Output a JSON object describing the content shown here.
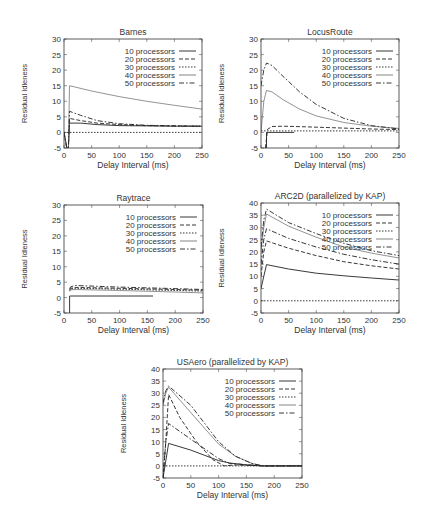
{
  "figure": {
    "ylabel": "Residual Idleness",
    "xlabel": "Delay Interval (ms)"
  },
  "chart_data": [
    {
      "id": "barnes",
      "type": "line",
      "title": "Barnes",
      "xlabel": "Delay Interval (ms)",
      "ylabel": "Residual Idleness",
      "xlim": [
        0,
        250
      ],
      "ylim": [
        -5,
        30
      ],
      "xticks": [
        0,
        50,
        100,
        150,
        200,
        250
      ],
      "yticks": [
        -5,
        0,
        5,
        10,
        15,
        20,
        25,
        30
      ],
      "legend_position": "upper right",
      "grid": false,
      "box": {
        "x": 64,
        "y": 39,
        "w": 138,
        "h": 109
      },
      "series": [
        {
          "name": "10 processors",
          "dash": "",
          "x": [
            0,
            5,
            8,
            10,
            30,
            60,
            100,
            150,
            200,
            250
          ],
          "values": [
            0,
            -5,
            -5,
            3,
            3,
            2.5,
            2.2,
            2.1,
            2.0,
            2.0
          ]
        },
        {
          "name": "20 processors",
          "dash": "4,2",
          "x": [
            0,
            5,
            8,
            10,
            30,
            60,
            100,
            150,
            200,
            250
          ],
          "values": [
            0,
            -5,
            -5,
            4.5,
            3.8,
            3.0,
            2.5,
            2.2,
            2.1,
            2.0
          ]
        },
        {
          "name": "30 processors",
          "dash": "1.5,1.5",
          "x": [
            0,
            250
          ],
          "values": [
            0,
            0
          ]
        },
        {
          "name": "40 processors",
          "dash": "",
          "light": true,
          "x": [
            0,
            5,
            8,
            10,
            50,
            100,
            150,
            200,
            250
          ],
          "values": [
            0,
            -5,
            -5,
            15,
            13.3,
            11.5,
            10,
            8.7,
            7.5
          ]
        },
        {
          "name": "50 processors",
          "dash": "5,2,1.5,2",
          "x": [
            0,
            5,
            8,
            10,
            30,
            60,
            100,
            150,
            200,
            250
          ],
          "values": [
            0,
            -5,
            -5,
            6.8,
            5.5,
            3.8,
            2.8,
            2.3,
            2.1,
            2.0
          ]
        }
      ]
    },
    {
      "id": "locusroute",
      "type": "line",
      "title": "LocusRoute",
      "xlabel": "Delay Interval (ms)",
      "ylabel": "Residual Idleness",
      "xlim": [
        0,
        250
      ],
      "ylim": [
        -5,
        30
      ],
      "xticks": [
        0,
        50,
        100,
        150,
        200,
        250
      ],
      "yticks": [
        -5,
        0,
        5,
        10,
        15,
        20,
        25,
        30
      ],
      "legend_position": "upper right",
      "grid": false,
      "box": {
        "x": 261,
        "y": 39,
        "w": 138,
        "h": 109
      },
      "series": [
        {
          "name": "10 processors",
          "dash": "",
          "x": [
            10,
            10,
            12,
            60
          ],
          "values": [
            -5,
            0,
            0,
            0
          ]
        },
        {
          "name": "20 processors",
          "dash": "4,2",
          "x": [
            8,
            12,
            20,
            40,
            80,
            150,
            200,
            250
          ],
          "values": [
            -5,
            1.0,
            1.9,
            2.0,
            1.8,
            1.4,
            1.1,
            0.9
          ]
        },
        {
          "name": "30 processors",
          "dash": "1.5,1.5",
          "x": [
            0,
            250
          ],
          "values": [
            0.5,
            0.5
          ]
        },
        {
          "name": "40 processors",
          "dash": "",
          "light": true,
          "x": [
            0,
            5,
            10,
            20,
            40,
            70,
            100,
            150,
            200,
            250
          ],
          "values": [
            0,
            10,
            13.5,
            13,
            10.5,
            7.5,
            5.3,
            3.2,
            2.0,
            1.3
          ]
        },
        {
          "name": "50 processors",
          "dash": "5,2,1.5,2",
          "x": [
            0,
            5,
            10,
            20,
            40,
            70,
            100,
            150,
            200,
            250
          ],
          "values": [
            15,
            20,
            22.3,
            21.5,
            18,
            13,
            9,
            4.5,
            2.2,
            1.1
          ]
        }
      ]
    },
    {
      "id": "raytrace",
      "type": "line",
      "title": "Raytrace",
      "xlabel": "Delay Interval (ms)",
      "ylabel": "Residual Idleness",
      "xlim": [
        0,
        250
      ],
      "ylim": [
        -5,
        30
      ],
      "xticks": [
        0,
        50,
        100,
        150,
        200,
        250
      ],
      "yticks": [
        -5,
        0,
        5,
        10,
        15,
        20,
        25,
        30
      ],
      "legend_position": "upper right",
      "grid": false,
      "box": {
        "x": 64,
        "y": 205,
        "w": 139,
        "h": 108
      },
      "series": [
        {
          "name": "10 processors",
          "dash": "",
          "x": [
            10,
            10,
            12,
            160
          ],
          "values": [
            -5,
            0.5,
            0.5,
            0.5
          ]
        },
        {
          "name": "20 processors",
          "dash": "4,2",
          "x": [
            10,
            12,
            20,
            100,
            200,
            250
          ],
          "values": [
            2.5,
            3.0,
            3.3,
            3.0,
            2.6,
            2.4
          ]
        },
        {
          "name": "30 processors",
          "dash": "1.5,1.5",
          "x": [
            10,
            12,
            20,
            100,
            200,
            250
          ],
          "values": [
            2.2,
            2.8,
            3.0,
            2.7,
            2.3,
            2.1
          ]
        },
        {
          "name": "40 processors",
          "dash": "",
          "light": true,
          "x": [
            10,
            12,
            20,
            100,
            200,
            250
          ],
          "values": [
            2.0,
            2.5,
            2.6,
            2.3,
            1.8,
            1.5
          ]
        },
        {
          "name": "50 processors",
          "dash": "5,2,1.5,2",
          "x": [
            10,
            12,
            20,
            100,
            200,
            250
          ],
          "values": [
            2.8,
            3.5,
            3.9,
            3.4,
            2.9,
            2.6
          ]
        }
      ]
    },
    {
      "id": "arc2d",
      "type": "line",
      "title": "ARC2D (parallelized by KAP)",
      "xlabel": "Delay Interval (ms)",
      "ylabel": "Residual Idleness",
      "xlim": [
        0,
        250
      ],
      "ylim": [
        -5,
        40
      ],
      "xticks": [
        0,
        50,
        100,
        150,
        200,
        250
      ],
      "yticks": [
        -5,
        0,
        5,
        10,
        15,
        20,
        25,
        30,
        35,
        40
      ],
      "legend_position": "upper right",
      "grid": false,
      "box": {
        "x": 261,
        "y": 203,
        "w": 138,
        "h": 110
      },
      "series": [
        {
          "name": "10 processors",
          "dash": "",
          "x": [
            0,
            5,
            10,
            50,
            100,
            150,
            200,
            250
          ],
          "values": [
            5,
            10,
            14.8,
            13,
            11.3,
            10.2,
            9.3,
            8.5
          ]
        },
        {
          "name": "20 processors",
          "dash": "4,2",
          "x": [
            0,
            5,
            10,
            50,
            100,
            150,
            200,
            250
          ],
          "values": [
            10,
            20,
            24.5,
            21.5,
            18.5,
            16,
            14.3,
            13
          ]
        },
        {
          "name": "30 processors",
          "dash": "1.5,1.5",
          "x": [
            0,
            250
          ],
          "values": [
            0,
            0
          ]
        },
        {
          "name": "40 processors",
          "dash": "",
          "light": true,
          "x": [
            0,
            5,
            10,
            50,
            100,
            150,
            200,
            250
          ],
          "values": [
            20,
            30,
            35.5,
            30.5,
            26,
            22,
            19.5,
            17.5
          ]
        },
        {
          "name": "50 processors",
          "dash": "5,2,1.5,2",
          "x": [
            0,
            5,
            10,
            50,
            100,
            150,
            200,
            250
          ],
          "values": [
            22,
            33,
            37.5,
            32,
            27.5,
            23.5,
            20.5,
            18.5
          ]
        },
        {
          "name": "29-ish series (unlabeled 5th band)",
          "dash": "5,2,1.5,2",
          "hidden_in_legend": true,
          "x": [
            0,
            5,
            10,
            50,
            100,
            150,
            200,
            250
          ],
          "values": [
            15,
            25,
            29.5,
            25.5,
            22,
            19,
            16.8,
            15
          ]
        }
      ]
    },
    {
      "id": "usaero",
      "type": "line",
      "title": "USAero (parallelized by KAP)",
      "xlabel": "Delay Interval (ms)",
      "ylabel": "Residual Idleness",
      "xlim": [
        0,
        250
      ],
      "ylim": [
        -5,
        40
      ],
      "xticks": [
        0,
        50,
        100,
        150,
        200,
        250
      ],
      "yticks": [
        -5,
        0,
        5,
        10,
        15,
        20,
        25,
        30,
        35,
        40
      ],
      "legend_position": "upper right",
      "grid": false,
      "box": {
        "x": 163,
        "y": 369,
        "w": 139,
        "h": 109
      },
      "series": [
        {
          "name": "10 processors",
          "dash": "",
          "x": [
            0,
            5,
            10,
            50,
            100,
            120,
            150,
            180,
            250
          ],
          "values": [
            -5,
            2,
            9.3,
            6.5,
            2.2,
            1.2,
            0.4,
            0,
            0
          ]
        },
        {
          "name": "20 processors",
          "dash": "4,2",
          "x": [
            0,
            5,
            10,
            30,
            60,
            90,
            110,
            130,
            180,
            250
          ],
          "values": [
            -5,
            10,
            29.5,
            20,
            10,
            2.5,
            0,
            0.4,
            0,
            0
          ]
        },
        {
          "name": "30 processors",
          "dash": "1.5,1.5",
          "x": [
            0,
            250
          ],
          "values": [
            0,
            0
          ]
        },
        {
          "name": "40 processors",
          "dash": "",
          "light": true,
          "x": [
            0,
            5,
            10,
            50,
            100,
            130,
            160,
            180,
            250
          ],
          "values": [
            25,
            30,
            32.5,
            22,
            9,
            4,
            1,
            0,
            0
          ]
        },
        {
          "name": "50 processors",
          "dash": "5,2,1.5,2",
          "x": [
            0,
            5,
            10,
            50,
            100,
            130,
            160,
            180,
            250
          ],
          "values": [
            26,
            31,
            33,
            25,
            10,
            4,
            1,
            0,
            0
          ]
        },
        {
          "name": "17-ish series",
          "dash": "5,2,1.5,2",
          "hidden_in_legend": true,
          "x": [
            0,
            5,
            10,
            50,
            100,
            120,
            180,
            250
          ],
          "values": [
            -5,
            10,
            17.5,
            11,
            3,
            1,
            0,
            0
          ]
        }
      ]
    }
  ]
}
